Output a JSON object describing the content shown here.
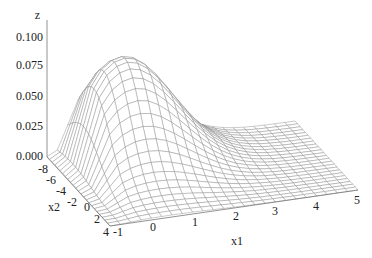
{
  "chart_data": {
    "type": "surface3d",
    "title": "",
    "axes": {
      "x1": {
        "label": "x1",
        "ticks": [
          "-1",
          "0",
          "1",
          "2",
          "3",
          "4",
          "5"
        ],
        "range": [
          -1,
          5
        ]
      },
      "x2": {
        "label": "x2",
        "ticks": [
          "-8",
          "-6",
          "-4",
          "-2",
          "0",
          "2",
          "4"
        ],
        "range": [
          -8,
          4
        ]
      },
      "z": {
        "label": "z",
        "ticks": [
          "0.000",
          "0.025",
          "0.050",
          "0.075",
          "0.100"
        ],
        "range": [
          0,
          0.1
        ]
      }
    },
    "surface": {
      "description": "Bivariate density-like bump peaking near x1≈0.5, x2≈-5 with z≈0.09, decaying to 0 toward x1=5",
      "peak": {
        "x1": 0.5,
        "x2": -5,
        "z": 0.09
      },
      "grid": {
        "x1_steps": 24,
        "x2_steps": 24
      }
    },
    "style": {
      "mesh_color": "#8a8a8a",
      "axis_color": "#777777",
      "background": "#ffffff"
    }
  }
}
